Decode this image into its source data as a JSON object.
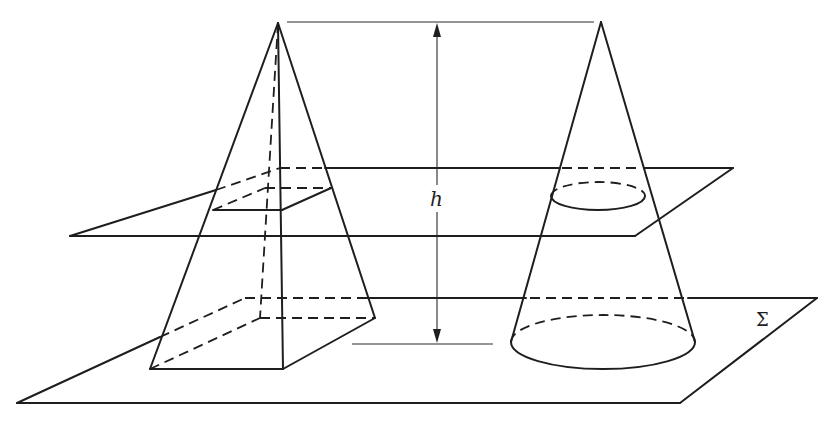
{
  "figure": {
    "labels": {
      "height": "h",
      "base_plane": "Σ"
    },
    "colors": {
      "stroke": "#1e1e1e",
      "background": "#ffffff"
    },
    "solids": [
      {
        "name": "pyramid",
        "apex": [
          278,
          23
        ],
        "base": [
          [
            150,
            369
          ],
          [
            283,
            369
          ],
          [
            375,
            318
          ],
          [
            260,
            318
          ]
        ],
        "section": [
          [
            213,
            210
          ],
          [
            282,
            210
          ],
          [
            331,
            188
          ],
          [
            265,
            188
          ]
        ]
      },
      {
        "name": "cone",
        "apex": [
          601,
          22
        ],
        "section_ellipse": {
          "cx": 598,
          "cy": 196,
          "rx": 47,
          "ry": 14
        },
        "base_ellipse": {
          "cx": 603,
          "cy": 342,
          "rx": 92,
          "ry": 27
        }
      }
    ],
    "planes": [
      {
        "name": "cutting-plane",
        "corners": [
          [
            70,
            236
          ],
          [
            635,
            236
          ],
          [
            733,
            168
          ],
          [
            280,
            168
          ]
        ]
      },
      {
        "name": "base-plane-sigma",
        "corners": [
          [
            17,
            403
          ],
          [
            680,
            403
          ],
          [
            817,
            298
          ],
          [
            245,
            298
          ]
        ]
      }
    ]
  }
}
